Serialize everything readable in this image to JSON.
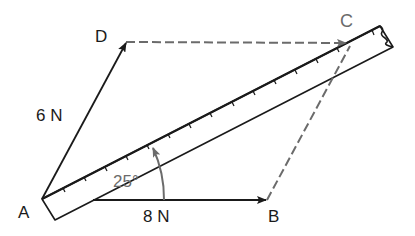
{
  "diagram": {
    "type": "vector-parallelogram-of-forces",
    "points": {
      "A": {
        "label": "A",
        "x": 42,
        "y": 199
      },
      "B": {
        "label": "B",
        "x": 267,
        "y": 200
      },
      "C": {
        "label": "C",
        "x": 352,
        "y": 43
      },
      "D": {
        "label": "D",
        "x": 126,
        "y": 42
      }
    },
    "vectors": [
      {
        "from": "A",
        "to": "D",
        "label": "6 N",
        "style": "solid-arrow"
      },
      {
        "from": "A",
        "to": "B",
        "label": "8 N",
        "style": "solid-arrow"
      },
      {
        "from": "A",
        "to": "C",
        "label": "",
        "style": "ruler-resultant"
      }
    ],
    "dashed_lines": [
      {
        "from": "D",
        "to": "C"
      },
      {
        "from": "B",
        "to": "C"
      }
    ],
    "angle": {
      "label": "25°",
      "between": [
        "AB",
        "AC"
      ]
    },
    "ruler": {
      "description": "ruler laid along AC with tick marks",
      "tick_count": 16
    }
  },
  "labels": {
    "A": "A",
    "B": "B",
    "C": "C",
    "D": "D",
    "force_AD": "6 N",
    "force_AB": "8 N",
    "angle": "25°"
  },
  "colors": {
    "line": "#1a1a1a",
    "dashed": "#6b6b6b",
    "angle": "#6b6b6b",
    "background": "#ffffff"
  }
}
